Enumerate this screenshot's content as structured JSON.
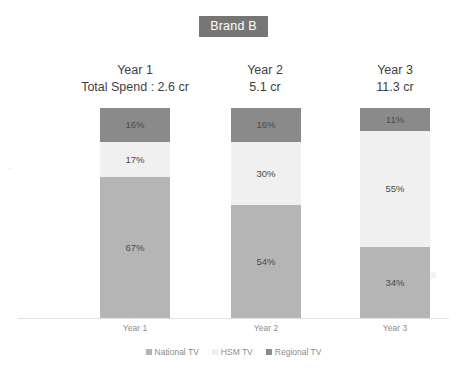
{
  "chart_title": "Brand B",
  "columns": [
    {
      "year": "Year 1",
      "spend": "Total Spend : 2.6 cr"
    },
    {
      "year": "Year 2",
      "spend": "5.1 cr"
    },
    {
      "year": "Year 3",
      "spend": "11.3 cr"
    }
  ],
  "axis_labels": [
    "Year 1",
    "Year 2",
    "Year 3"
  ],
  "legend": [
    {
      "label": "National TV",
      "color": "#b5b5b5"
    },
    {
      "label": "HSM TV",
      "color": "#f0f0f0"
    },
    {
      "label": "Regional TV",
      "color": "#8a8a8a"
    }
  ],
  "colors": {
    "national_tv": "#b5b5b5",
    "hsm_tv": "#f0f0f0",
    "regional_tv": "#8a8a8a",
    "title_badge": "#767676",
    "axis_line": "#e2e2e2",
    "label_text": "#4a4a4a",
    "tick_text": "#8d8d8d",
    "background": "#ffffff"
  },
  "segment_labels": {
    "y1": {
      "regional": "16%",
      "hsm": "17%",
      "national": "67%"
    },
    "y2": {
      "regional": "16%",
      "hsm": "30%",
      "national": "54%"
    },
    "y3": {
      "regional": "11%",
      "hsm": "55%",
      "national": "34%"
    }
  },
  "chart_data": {
    "type": "bar",
    "subtype": "100% stacked column",
    "title": "Brand B",
    "xlabel": "",
    "ylabel": "",
    "ylim": [
      0,
      100
    ],
    "grid": false,
    "legend_position": "bottom",
    "stacked": true,
    "normalized_percent": true,
    "categories": [
      "Year 1",
      "Year 2",
      "Year 3"
    ],
    "series": [
      {
        "name": "National TV",
        "values": [
          67,
          54,
          34
        ],
        "color": "#b5b5b5"
      },
      {
        "name": "HSM TV",
        "values": [
          17,
          30,
          55
        ],
        "color": "#f0f0f0"
      },
      {
        "name": "Regional TV",
        "values": [
          16,
          16,
          11
        ],
        "color": "#8a8a8a"
      }
    ],
    "stack_order_top_to_bottom": [
      "Regional TV",
      "HSM TV",
      "National TV"
    ],
    "data_labels": [
      [
        "16%",
        "17%",
        "67%"
      ],
      [
        "16%",
        "30%",
        "54%"
      ],
      [
        "11%",
        "55%",
        "34%"
      ]
    ],
    "annotations": {
      "total_spend": [
        {
          "category": "Year 1",
          "text": "Total Spend : 2.6 cr",
          "value": 2.6,
          "unit": "cr"
        },
        {
          "category": "Year 2",
          "text": "5.1 cr",
          "value": 5.1,
          "unit": "cr"
        },
        {
          "category": "Year 3",
          "text": "11.3 cr",
          "value": 11.3,
          "unit": "cr"
        }
      ]
    }
  }
}
